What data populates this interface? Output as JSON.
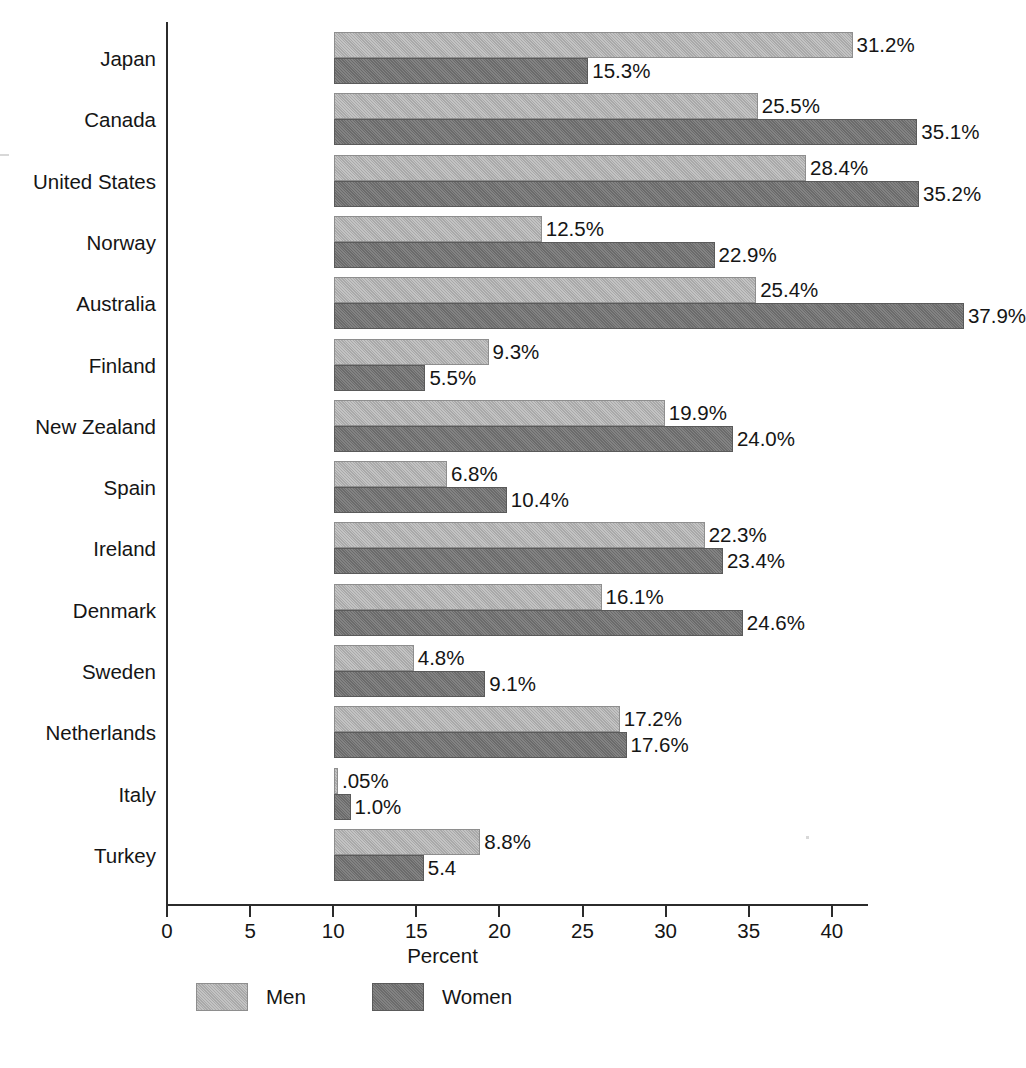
{
  "chart_data": {
    "type": "bar",
    "orientation": "horizontal",
    "title": "",
    "xlabel": "Percent",
    "ylabel": "",
    "xlim": [
      0,
      43
    ],
    "xticks": [
      0,
      5,
      10,
      15,
      20,
      25,
      30,
      35,
      40
    ],
    "xtick_labels": [
      "0",
      "5",
      "10",
      "15",
      "20",
      "25",
      "30",
      "35",
      "40"
    ],
    "grid": false,
    "legend_position": "bottom-left",
    "categories": [
      "Japan",
      "Canada",
      "United States",
      "Norway",
      "Australia",
      "Finland",
      "New Zealand",
      "Spain",
      "Ireland",
      "Denmark",
      "Sweden",
      "Netherlands",
      "Italy",
      "Turkey"
    ],
    "series": [
      {
        "name": "Men",
        "color": "#a9a9a9",
        "values": [
          31.2,
          25.5,
          28.4,
          12.5,
          25.4,
          9.3,
          19.9,
          6.8,
          22.3,
          16.1,
          4.8,
          17.2,
          0.05,
          8.8
        ],
        "labels": [
          ".05%"
        ]
      },
      {
        "name": "Women",
        "color": "#6b6b6b",
        "values": [
          15.3,
          35.1,
          35.2,
          22.9,
          37.9,
          5.5,
          24.0,
          10.4,
          23.4,
          24.6,
          9.1,
          17.6,
          1.0,
          5.4
        ]
      }
    ],
    "data_labels": {
      "Japan": {
        "men": "31.2%",
        "women": "15.3%"
      },
      "Canada": {
        "men": "25.5%",
        "women": "35.1%"
      },
      "United States": {
        "men": "28.4%",
        "women": "35.2%"
      },
      "Norway": {
        "men": "12.5%",
        "women": "22.9%"
      },
      "Australia": {
        "men": "25.4%",
        "women": "37.9%"
      },
      "Finland": {
        "men": "9.3%",
        "women": "5.5%"
      },
      "New Zealand": {
        "men": "19.9%",
        "women": "24.0%"
      },
      "Spain": {
        "men": "6.8%",
        "women": "10.4%"
      },
      "Ireland": {
        "men": "22.3%",
        "women": "23.4%"
      },
      "Denmark": {
        "men": "16.1%",
        "women": "24.6%"
      },
      "Sweden": {
        "men": "4.8%",
        "women": "9.1%"
      },
      "Netherlands": {
        "men": "17.2%",
        "women": "17.6%"
      },
      "Italy": {
        "men": ".05%",
        "women": "1.0%"
      },
      "Turkey": {
        "men": "8.8%",
        "women": "5.4"
      }
    }
  },
  "legend": {
    "items": [
      {
        "label": "Men",
        "color": "#a9a9a9"
      },
      {
        "label": "Women",
        "color": "#6b6b6b"
      }
    ]
  },
  "axis": {
    "x_title": "Percent"
  }
}
